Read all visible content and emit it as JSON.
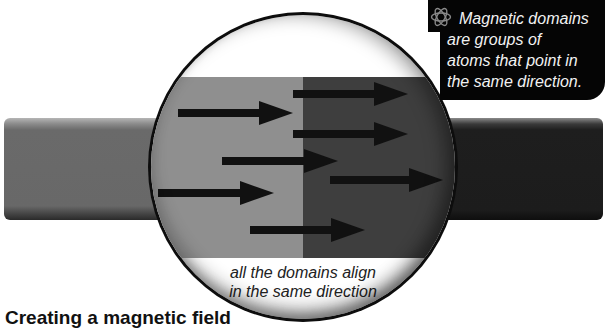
{
  "callout": {
    "icon": "atom-icon",
    "lines": [
      "Magnetic domains",
      "are groups of",
      "atoms that point in",
      "the same direction."
    ]
  },
  "lens": {
    "caption_lines": [
      "all the domains align",
      "in the same direction"
    ],
    "colors": {
      "light_domain": "#8f8f8f",
      "dark_domain": "#3e3e3e",
      "rim": "#0d0d0d"
    }
  },
  "magnet": {
    "left_color": "#6a6a6a",
    "right_color": "#1c1c1c"
  },
  "heading": "Creating a magnetic field",
  "arrows": [
    {
      "x1": 178,
      "x2": 293,
      "y": 113
    },
    {
      "x1": 293,
      "x2": 408,
      "y": 94
    },
    {
      "x1": 293,
      "x2": 408,
      "y": 134
    },
    {
      "x1": 222,
      "x2": 338,
      "y": 161
    },
    {
      "x1": 330,
      "x2": 443,
      "y": 180
    },
    {
      "x1": 158,
      "x2": 274,
      "y": 193
    },
    {
      "x1": 250,
      "x2": 365,
      "y": 230
    }
  ]
}
